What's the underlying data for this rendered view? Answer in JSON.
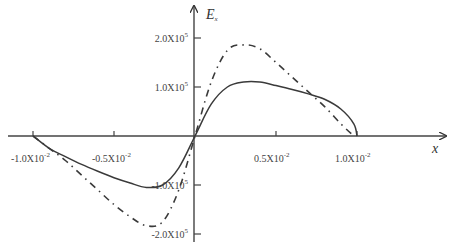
{
  "chart_data": {
    "type": "line",
    "title": "",
    "xlabel": "x",
    "ylabel": "E_x",
    "xlim": [
      -0.011,
      0.0155
    ],
    "ylim": [
      -210000.0,
      260000.0
    ],
    "grid": false,
    "legend": null,
    "x_ticks": [
      {
        "value": -0.01,
        "label": "-1.0X10",
        "exp": "-2"
      },
      {
        "value": -0.005,
        "label": "-0.5X10",
        "exp": "-2"
      },
      {
        "value": 0.005,
        "label": "0.5X10",
        "exp": "-2"
      },
      {
        "value": 0.01,
        "label": "1.0X10",
        "exp": "-2"
      }
    ],
    "y_ticks": [
      {
        "value": 200000,
        "label": "2.0X10",
        "exp": "5"
      },
      {
        "value": 100000,
        "label": "1.0X10",
        "exp": "5"
      },
      {
        "value": -100000,
        "label": "-1.0X10",
        "exp": "5"
      },
      {
        "value": -200000,
        "label": "-2.0X10",
        "exp": "5"
      }
    ],
    "series": [
      {
        "name": "solid",
        "style": "solid",
        "x": [
          -0.01,
          -0.009,
          -0.008,
          -0.007,
          -0.006,
          -0.005,
          -0.004,
          -0.003,
          -0.002,
          -0.001,
          0,
          0.001,
          0.002,
          0.003,
          0.004,
          0.005,
          0.006,
          0.007,
          0.008,
          0.009,
          0.0098,
          0.01
        ],
        "values": [
          0,
          -25000,
          -42000,
          -58000,
          -72000,
          -85000,
          -96000,
          -105000,
          -100000,
          -65000,
          0,
          65000,
          100000,
          110000,
          110000,
          103000,
          95000,
          86000,
          75000,
          55000,
          25000,
          0
        ]
      },
      {
        "name": "dash-dot",
        "style": "dashdot",
        "x": [
          -0.01,
          -0.009,
          -0.008,
          -0.007,
          -0.006,
          -0.005,
          -0.004,
          -0.003,
          -0.002,
          -0.001,
          0,
          0.001,
          0.002,
          0.003,
          0.004,
          0.005,
          0.006,
          0.007,
          0.008,
          0.009,
          0.0098
        ],
        "values": [
          0,
          -25000,
          -50000,
          -80000,
          -110000,
          -140000,
          -165000,
          -183000,
          -175000,
          -110000,
          0,
          110000,
          175000,
          186000,
          178000,
          150000,
          120000,
          90000,
          60000,
          25000,
          0
        ]
      }
    ]
  },
  "axes": {
    "x_label": "x",
    "y_label_main": "E",
    "y_label_sub": "x"
  }
}
